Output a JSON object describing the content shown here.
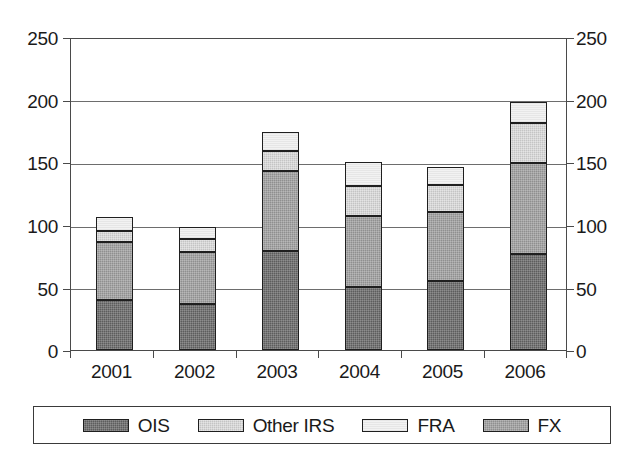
{
  "chart_data": {
    "type": "bar",
    "stacked": true,
    "title": "",
    "xlabel": "",
    "ylabel": "",
    "categories": [
      "2001",
      "2002",
      "2003",
      "2004",
      "2005",
      "2006"
    ],
    "series": [
      {
        "name": "OIS",
        "color": "#5d5d5d",
        "values": [
          40,
          37,
          79,
          50,
          55,
          77
        ]
      },
      {
        "name": "FX",
        "color": "#8f8f8f",
        "values": [
          46,
          41,
          64,
          57,
          55,
          72
        ]
      },
      {
        "name": "Other IRS",
        "color": "#c4c4c4",
        "values": [
          9,
          11,
          16,
          24,
          22,
          32
        ]
      },
      {
        "name": "FRA",
        "color": "#f2f2f2",
        "values": [
          11,
          9,
          15,
          19,
          14,
          17
        ]
      }
    ],
    "stack_order_bottom_to_top": [
      "OIS",
      "FX",
      "Other IRS",
      "FRA"
    ],
    "totals": [
      106,
      98,
      174,
      150,
      146,
      198
    ],
    "ylim": [
      0,
      250
    ],
    "yticks": [
      0,
      50,
      100,
      150,
      200,
      250
    ],
    "ytick_labels_left": [
      "0",
      "50",
      "100",
      "150",
      "200",
      "250"
    ],
    "ytick_labels_right": [
      "0",
      "50",
      "100",
      "150",
      "200",
      "250"
    ],
    "grid": "horizontal",
    "dual_y_axis": true,
    "legend_position": "bottom",
    "legend_entries": [
      {
        "label": "OIS",
        "swatch": "#5d5d5d"
      },
      {
        "label": "Other IRS",
        "swatch": "#c4c4c4"
      },
      {
        "label": "FRA",
        "swatch": "#f2f2f2"
      },
      {
        "label": "FX",
        "swatch": "#8f8f8f"
      }
    ]
  },
  "axis": {
    "left_ticks": [
      "250",
      "200",
      "150",
      "100",
      "50",
      "0"
    ],
    "right_ticks": [
      "250",
      "200",
      "150",
      "100",
      "50",
      "0"
    ],
    "x_ticks": [
      "2001",
      "2002",
      "2003",
      "2004",
      "2005",
      "2006"
    ]
  },
  "legend": {
    "items": [
      {
        "label": "OIS"
      },
      {
        "label": "Other IRS"
      },
      {
        "label": "FRA"
      },
      {
        "label": "FX"
      }
    ]
  }
}
